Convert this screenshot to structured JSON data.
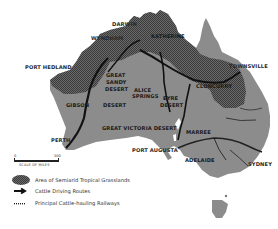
{
  "map": {
    "title": "Australia cattle routes and semiarid tropical grasslands",
    "colors": {
      "land": "#8a8a8a",
      "grassland": "#5a5a5a",
      "route": "#111111",
      "railway": "#2a2a2a",
      "background": "#ffffff"
    },
    "cities": {
      "darwin": "DARWIN",
      "wyndham": "WYNDHAM",
      "katherine": "KATHERINE",
      "port_hedland": "PORT HEDLAND",
      "townsville": "TOWNSVILLE",
      "cloncurry": "CLONCURRY",
      "alice_springs_1": "ALICE",
      "alice_springs_2": "SPRINGS",
      "perth": "PERTH",
      "port_augusta": "PORT AUGUSTA",
      "marree": "MARREE",
      "adelaide": "ADELAIDE",
      "sydney": "SYDNEY"
    },
    "regions": {
      "great_sandy_1": "GREAT",
      "great_sandy_2": "SANDY",
      "great_sandy_3": "DESERT",
      "gibson": "GIBSON",
      "gibson_desert": "DESERT",
      "great_victoria": "GREAT VICTORIA DESERT",
      "eyre_1": "EYRE",
      "eyre_2": "DESERT"
    },
    "trails": {
      "canning": "Canning Trail",
      "murranji": "Murranji Track",
      "birdsville": "Birdsville Trail",
      "strzelecki": "Strzelecki Trail",
      "barkly": "Barkly Stock Route"
    }
  },
  "scale": {
    "start": "0",
    "end": "500",
    "title": "SCALE OF MILES"
  },
  "legend": {
    "items": [
      {
        "label": "Area of Semiarid Tropical Grasslands",
        "symbol": "grassland-hatch"
      },
      {
        "label": "Cattle Driving Routes",
        "symbol": "thick-arrow"
      },
      {
        "label": "Principal Cattle-hauling Railways",
        "symbol": "railway-line"
      }
    ]
  }
}
